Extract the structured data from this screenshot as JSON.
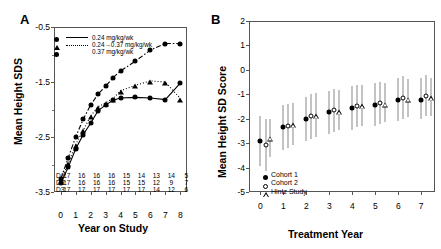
{
  "chart_data": [
    {
      "type": "line",
      "panel": "A",
      "title": "",
      "xlabel": "Year on Study",
      "ylabel": "Mean Height SDS",
      "xlim": [
        -0.45,
        8.45
      ],
      "ylim": [
        -3.5,
        -0.5
      ],
      "xticks": [
        0,
        1,
        2,
        3,
        4,
        5,
        6,
        7,
        8
      ],
      "yticks": [
        -0.5,
        -1.5,
        -2.5,
        -3.5
      ],
      "yticklabels": [
        "-0.5",
        "-1.5",
        "-2.5",
        "-3.5"
      ],
      "grid": false,
      "legend_position": "top-left",
      "series": [
        {
          "name": "0.24 mg/kg/wk",
          "linestyle": "solid",
          "marker": "circle",
          "x": [
            0,
            0.5,
            1,
            1.5,
            2,
            2.5,
            3,
            3.5,
            4,
            5,
            6,
            7,
            8
          ],
          "values": [
            -3.34,
            -3.05,
            -2.72,
            -2.46,
            -2.25,
            -2.02,
            -1.92,
            -1.83,
            -1.79,
            -1.78,
            -1.79,
            -1.82,
            -1.52
          ]
        },
        {
          "name": "0.24→0.37 mg/kg/wk",
          "linestyle": "dotted",
          "marker": "triangle",
          "x": [
            0,
            0.5,
            1,
            1.5,
            2,
            2.5,
            3,
            3.5,
            4,
            5,
            6,
            7,
            8
          ],
          "values": [
            -3.3,
            -2.98,
            -2.64,
            -2.38,
            -2.12,
            -1.95,
            -1.88,
            -1.8,
            -1.66,
            -1.56,
            -1.48,
            -1.5,
            -1.8
          ]
        },
        {
          "name": "0.37 mg/kg/wk",
          "linestyle": "dash-dot",
          "marker": "circle",
          "x": [
            0,
            0.5,
            1,
            1.5,
            2,
            2.5,
            3,
            3.5,
            4,
            5,
            6,
            7,
            8
          ],
          "values": [
            -3.26,
            -2.88,
            -2.5,
            -2.18,
            -1.92,
            -1.72,
            -1.58,
            -1.42,
            -1.3,
            -1.12,
            -0.92,
            -0.8,
            -0.8
          ]
        }
      ],
      "counts_table": {
        "row_labels": [
          "D1:",
          "D2:",
          "D3:"
        ],
        "columns": [
          0,
          1,
          2,
          3,
          4,
          5,
          6,
          7,
          8
        ],
        "rows": [
          [
            17,
            16,
            16,
            16,
            15,
            14,
            13,
            14,
            5
          ],
          [
            17,
            16,
            16,
            16,
            15,
            15,
            12,
            9,
            7
          ],
          [
            17,
            17,
            17,
            17,
            17,
            17,
            14,
            12,
            6
          ]
        ]
      }
    },
    {
      "type": "scatter",
      "panel": "B",
      "title": "",
      "xlabel": "Treatment  Year",
      "ylabel": "Mean Height SD Score",
      "xlim": [
        -0.5,
        7.6
      ],
      "ylim": [
        -5,
        2
      ],
      "xticks": [
        0,
        1,
        2,
        3,
        4,
        5,
        6,
        7
      ],
      "yticks": [
        2,
        1,
        0,
        -1,
        -2,
        -3,
        -4,
        -5
      ],
      "yticklabels": [
        "2",
        "1",
        "0",
        "-1",
        "-2",
        "-3",
        "-4",
        "-5"
      ],
      "grid": false,
      "legend_position": "bottom-left",
      "errorbars": true,
      "series": [
        {
          "name": "Cohort 1",
          "marker": "filled-circle",
          "x": [
            0,
            1,
            2,
            3,
            4,
            5,
            6,
            7
          ],
          "values": [
            -2.9,
            -2.35,
            -2.0,
            -1.73,
            -1.55,
            -1.42,
            -1.25,
            -1.22
          ],
          "err_low": [
            -3.95,
            -3.28,
            -2.92,
            -2.62,
            -2.45,
            -2.3,
            -2.1,
            -2.02
          ],
          "err_high": [
            -1.9,
            -1.45,
            -1.1,
            -0.85,
            -0.68,
            -0.55,
            -0.35,
            -0.32
          ]
        },
        {
          "name": "Cohort 2",
          "marker": "open-circle",
          "x": [
            0.22,
            1.22,
            2.22,
            3.22,
            4.22,
            5.22,
            6.22,
            7.22
          ],
          "values": [
            -3.08,
            -2.28,
            -1.88,
            -1.65,
            -1.48,
            -1.35,
            -1.15,
            -1.08
          ],
          "err_low": [
            -4.15,
            -3.2,
            -2.82,
            -2.55,
            -2.35,
            -2.22,
            -2.0,
            -1.9
          ],
          "err_high": [
            -2.02,
            -1.38,
            -0.98,
            -0.78,
            -0.6,
            -0.48,
            -0.25,
            -0.22
          ]
        },
        {
          "name": "Hintz Study",
          "marker": "open-triangle",
          "x": [
            0.42,
            1.42,
            2.42,
            3.42,
            4.42,
            5.42,
            6.42,
            7.42
          ],
          "values": [
            -2.78,
            -2.22,
            -1.85,
            -1.68,
            -1.45,
            -1.38,
            -1.18,
            -1.12
          ],
          "err_low": [
            -3.55,
            -3.08,
            -2.75,
            -2.48,
            -2.28,
            -2.15,
            -1.95,
            -1.88
          ],
          "err_high": [
            -2.02,
            -1.35,
            -0.95,
            -0.82,
            -0.62,
            -0.55,
            -0.38,
            -0.34
          ]
        }
      ]
    }
  ],
  "panel_a": {
    "letter": "A",
    "ylabel": "Mean Height SDS",
    "xlabel": "Year on Study",
    "yticklabels": [
      "-0.5",
      "-1.5",
      "-2.5",
      "-3.5"
    ],
    "xticklabels": [
      "0",
      "1",
      "2",
      "3",
      "4",
      "5",
      "6",
      "7",
      "8"
    ],
    "legend": [
      {
        "label": "0.24 mg/kg/wk",
        "style": "sw-solid",
        "marker": "circle"
      },
      {
        "label": "0.24→0.37 mg/kg/wk",
        "style": "sw-dot",
        "marker": "tri"
      },
      {
        "label": "0.37 mg/kg/wk",
        "style": "sw-dashdot",
        "marker": "circle"
      }
    ],
    "counts": {
      "row_labels": [
        "D1:",
        "D2:",
        "D3:"
      ],
      "rows": [
        [
          "17",
          "16",
          "16",
          "16",
          "15",
          "14",
          "13",
          "14",
          "5"
        ],
        [
          "17",
          "16",
          "16",
          "16",
          "15",
          "15",
          "12",
          "9",
          "7"
        ],
        [
          "17",
          "17",
          "17",
          "17",
          "17",
          "17",
          "14",
          "12",
          "6"
        ]
      ]
    }
  },
  "panel_b": {
    "letter": "B",
    "ylabel": "Mean Height SD Score",
    "xlabel": "Treatment  Year",
    "yticklabels": [
      "2",
      "1",
      "0",
      "-1",
      "-2",
      "-3",
      "-4",
      "-5"
    ],
    "xticklabels": [
      "0",
      "1",
      "2",
      "3",
      "4",
      "5",
      "6",
      "7"
    ],
    "legend": [
      {
        "label": "Cohort 1",
        "marker": "circle"
      },
      {
        "label": "Cohort 2",
        "marker": "ocircle"
      },
      {
        "label": "Hintz Study",
        "marker": "otri"
      }
    ]
  }
}
